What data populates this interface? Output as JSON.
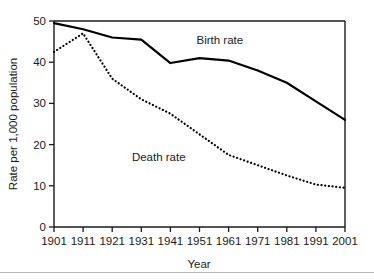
{
  "chart_data": {
    "type": "line",
    "title": "",
    "xlabel": "Year",
    "ylabel": "Rate per 1,000 population",
    "categories": [
      1901,
      1911,
      1921,
      1931,
      1941,
      1951,
      1961,
      1971,
      1981,
      1991,
      2001
    ],
    "xtick_labels": [
      "1901",
      "1911",
      "1921",
      "1931",
      "1941",
      "1951",
      "1961",
      "1971",
      "1981",
      "1991",
      "2001"
    ],
    "ytick_labels": [
      "0",
      "10",
      "20",
      "30",
      "40",
      "50"
    ],
    "ytick_values": [
      0,
      10,
      20,
      30,
      40,
      50
    ],
    "xlim": [
      1901,
      2001
    ],
    "ylim": [
      0,
      50
    ],
    "grid": false,
    "legend_position": "inline-annotation",
    "series": [
      {
        "name": "Birth rate",
        "style": "solid",
        "color": "#000000",
        "label_x": 1958,
        "label_y": 44.5,
        "values": [
          49.5,
          48.0,
          46.0,
          45.5,
          39.8,
          41.0,
          40.4,
          38.0,
          35.0,
          30.5,
          26.0
        ]
      },
      {
        "name": "Death rate",
        "style": "dotted",
        "color": "#000000",
        "label_x": 1937,
        "label_y": 16.0,
        "values": [
          42.5,
          47.0,
          36.0,
          31.0,
          27.5,
          22.5,
          17.5,
          15.0,
          12.5,
          10.3,
          9.5
        ]
      }
    ],
    "annotations": [
      {
        "text": "Birth rate",
        "x": 1958,
        "y": 44.5
      },
      {
        "text": "Death rate",
        "x": 1937,
        "y": 16.0
      }
    ]
  }
}
